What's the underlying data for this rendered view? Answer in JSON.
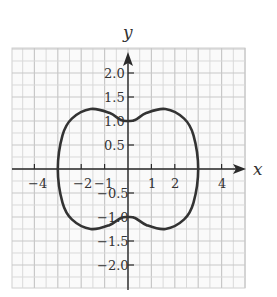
{
  "chart_data": {
    "type": "line",
    "title": "",
    "xlabel": "x",
    "ylabel": "y",
    "xlim": [
      -4.9,
      4.9
    ],
    "ylim": [
      -2.5,
      2.5
    ],
    "grid": true,
    "x_ticks": [
      -4,
      -2,
      -1,
      1,
      2,
      4
    ],
    "x_tick_labels": [
      "−4",
      "−2",
      "−1",
      "1",
      "2",
      "4"
    ],
    "y_ticks": [
      2.0,
      1.5,
      1.0,
      0.5,
      -0.5,
      -1.0,
      -1.5,
      -2.0
    ],
    "y_tick_labels": [
      "2.0",
      "1.5",
      "1.0",
      "0.5",
      "−0.5",
      "−1.0",
      "−1.5",
      "−2.0"
    ],
    "series": [
      {
        "name": "closed curve",
        "description": "Closed symmetric curve with x-intercepts at ±3, y-intercepts at ±1, and extrema near (±1.6, ±1.25)",
        "points": [
          [
            3.0,
            0.0
          ],
          [
            2.8,
            0.7
          ],
          [
            2.4,
            1.05
          ],
          [
            1.6,
            1.25
          ],
          [
            0.8,
            1.17
          ],
          [
            0.3,
            1.02
          ],
          [
            0.0,
            1.0
          ],
          [
            -0.3,
            1.02
          ],
          [
            -0.8,
            1.17
          ],
          [
            -1.6,
            1.25
          ],
          [
            -2.4,
            1.05
          ],
          [
            -2.8,
            0.7
          ],
          [
            -3.0,
            0.0
          ],
          [
            -2.8,
            -0.7
          ],
          [
            -2.4,
            -1.05
          ],
          [
            -1.6,
            -1.25
          ],
          [
            -0.8,
            -1.17
          ],
          [
            -0.3,
            -1.02
          ],
          [
            0.0,
            -1.0
          ],
          [
            0.3,
            -1.02
          ],
          [
            0.8,
            -1.17
          ],
          [
            1.6,
            -1.25
          ],
          [
            2.4,
            -1.05
          ],
          [
            2.8,
            -0.7
          ],
          [
            3.0,
            0.0
          ]
        ]
      }
    ],
    "x_intercepts": [
      -3,
      3
    ],
    "y_intercepts": [
      -1,
      1
    ]
  },
  "labels": {
    "x_axis": "x",
    "y_axis": "y",
    "x_ticks": [
      "−4",
      "−2",
      "−1",
      "1",
      "2",
      "4"
    ],
    "y_ticks": [
      "2.0",
      "1.5",
      "1.0",
      "0.5",
      "−0.5",
      "−1.0",
      "−1.5",
      "−2.0"
    ]
  }
}
